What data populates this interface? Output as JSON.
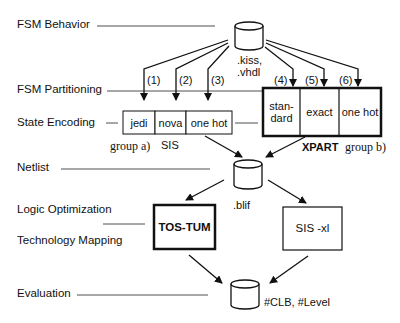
{
  "stages": {
    "fsm_behavior": "FSM Behavior",
    "fsm_partitioning": "FSM Partitioning",
    "state_encoding": "State Encoding",
    "netlist": "Netlist",
    "logic_optimization": "Logic Optimization",
    "technology_mapping": "Technology Mapping",
    "evaluation": "Evaluation"
  },
  "nodes": {
    "input_db": ".kiss,\n.vhdl",
    "input_db_line1": ".kiss,",
    "input_db_line2": ".vhdl",
    "netlist_db": ".blif",
    "result_db": "#CLB, #Level"
  },
  "paths": [
    "(1)",
    "(2)",
    "(3)",
    "(4)",
    "(5)",
    "(6)"
  ],
  "group_a": {
    "cells": [
      "jedi",
      "nova",
      "one hot"
    ],
    "tool": "SIS",
    "label": "group a)"
  },
  "group_b": {
    "cells_line1": [
      "stan-",
      "exact",
      "one hot"
    ],
    "cells_line2": [
      "dard"
    ],
    "tool": "XPART",
    "label": "group b)"
  },
  "optimizers": {
    "left": "TOS-TUM",
    "right": "SIS -xl"
  }
}
